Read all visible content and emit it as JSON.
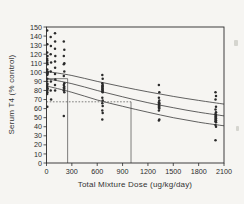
{
  "figure": {
    "background": "#f6f5f2",
    "ink": "#2b2b2b",
    "curve_color": "#3a3a3a"
  },
  "chart_data": {
    "type": "scatter",
    "title": "",
    "xlabel": "Total Mixture Dose (ug/kg/day)",
    "ylabel": "Serum T4 (% control)",
    "xlim": [
      0,
      2100
    ],
    "ylim": [
      0,
      150
    ],
    "x_ticks": [
      0,
      300,
      600,
      900,
      1200,
      1500,
      1800,
      2100
    ],
    "y_ticks": [
      0,
      10,
      20,
      30,
      40,
      50,
      60,
      70,
      80,
      90,
      100,
      110,
      120,
      130,
      140,
      150
    ],
    "grid": false,
    "legend": null,
    "points": [
      [
        8,
        146
      ],
      [
        10,
        131
      ],
      [
        8,
        122
      ],
      [
        12,
        118
      ],
      [
        8,
        115
      ],
      [
        10,
        113
      ],
      [
        8,
        111
      ],
      [
        12,
        109
      ],
      [
        8,
        103
      ],
      [
        10,
        101
      ],
      [
        14,
        100
      ],
      [
        8,
        99
      ],
      [
        12,
        98
      ],
      [
        8,
        97
      ],
      [
        10,
        93
      ],
      [
        8,
        90
      ],
      [
        12,
        87
      ],
      [
        8,
        85
      ],
      [
        10,
        83
      ],
      [
        14,
        82
      ],
      [
        8,
        80
      ],
      [
        10,
        78
      ],
      [
        8,
        76
      ],
      [
        10,
        62
      ],
      [
        50,
        139
      ],
      [
        52,
        129
      ],
      [
        50,
        120
      ],
      [
        54,
        111
      ],
      [
        50,
        101
      ],
      [
        52,
        90
      ],
      [
        50,
        80
      ],
      [
        54,
        70
      ],
      [
        100,
        143
      ],
      [
        102,
        134
      ],
      [
        100,
        126
      ],
      [
        104,
        118
      ],
      [
        100,
        112
      ],
      [
        102,
        105
      ],
      [
        100,
        98
      ],
      [
        104,
        92
      ],
      [
        100,
        86
      ],
      [
        102,
        80
      ],
      [
        205,
        134
      ],
      [
        210,
        125
      ],
      [
        205,
        118
      ],
      [
        210,
        110
      ],
      [
        205,
        109
      ],
      [
        210,
        101
      ],
      [
        205,
        96
      ],
      [
        210,
        88
      ],
      [
        205,
        86
      ],
      [
        210,
        84
      ],
      [
        205,
        83
      ],
      [
        210,
        82
      ],
      [
        205,
        80
      ],
      [
        210,
        78
      ],
      [
        205,
        52
      ],
      [
        660,
        97
      ],
      [
        665,
        93
      ],
      [
        660,
        88
      ],
      [
        665,
        86
      ],
      [
        660,
        85
      ],
      [
        665,
        84
      ],
      [
        660,
        83
      ],
      [
        665,
        82
      ],
      [
        660,
        81
      ],
      [
        665,
        80
      ],
      [
        660,
        79
      ],
      [
        665,
        78
      ],
      [
        660,
        72
      ],
      [
        665,
        69
      ],
      [
        660,
        66
      ],
      [
        665,
        63
      ],
      [
        660,
        58
      ],
      [
        665,
        55
      ],
      [
        660,
        48
      ],
      [
        1330,
        86
      ],
      [
        1335,
        78
      ],
      [
        1330,
        72
      ],
      [
        1335,
        69
      ],
      [
        1330,
        67
      ],
      [
        1335,
        66
      ],
      [
        1330,
        65
      ],
      [
        1335,
        64
      ],
      [
        1330,
        63
      ],
      [
        1335,
        62
      ],
      [
        1330,
        61
      ],
      [
        1335,
        60
      ],
      [
        1330,
        58
      ],
      [
        1335,
        48
      ],
      [
        1330,
        47
      ],
      [
        2000,
        78
      ],
      [
        2005,
        74
      ],
      [
        2000,
        70
      ],
      [
        2005,
        62
      ],
      [
        2000,
        59
      ],
      [
        2005,
        56
      ],
      [
        2000,
        54
      ],
      [
        2005,
        53
      ],
      [
        2000,
        52
      ],
      [
        2005,
        51
      ],
      [
        2000,
        50
      ],
      [
        2005,
        49
      ],
      [
        2000,
        48
      ],
      [
        2005,
        47
      ],
      [
        2000,
        46
      ],
      [
        2005,
        45
      ],
      [
        2000,
        42
      ],
      [
        2005,
        40
      ],
      [
        2000,
        25
      ]
    ],
    "curves": [
      {
        "name": "upper-confidence-curve",
        "points": [
          [
            0,
            101
          ],
          [
            300,
            96.5
          ],
          [
            600,
            90
          ],
          [
            900,
            84
          ],
          [
            1200,
            78.5
          ],
          [
            1500,
            73.5
          ],
          [
            1800,
            69
          ],
          [
            2100,
            65
          ]
        ]
      },
      {
        "name": "fitted-curve",
        "points": [
          [
            0,
            93
          ],
          [
            300,
            87.5
          ],
          [
            600,
            80
          ],
          [
            900,
            73
          ],
          [
            1200,
            66.5
          ],
          [
            1500,
            61
          ],
          [
            1800,
            56
          ],
          [
            2100,
            52
          ]
        ]
      },
      {
        "name": "lower-confidence-curve",
        "points": [
          [
            0,
            85
          ],
          [
            300,
            78
          ],
          [
            600,
            69.5
          ],
          [
            900,
            62.5
          ],
          [
            1200,
            56
          ],
          [
            1500,
            50
          ],
          [
            1800,
            45
          ],
          [
            2100,
            41
          ]
        ]
      }
    ],
    "reference_lines": [
      {
        "name": "effect-level-upper-hline",
        "type": "horizontal",
        "value": 93,
        "from_dose": 0,
        "to_dose": 250,
        "style": "solid"
      },
      {
        "name": "effective-dose-upper-vline",
        "type": "vertical",
        "dose": 250,
        "from_value": 0,
        "to_value": 93,
        "style": "solid"
      },
      {
        "name": "effect-level-lower-hline",
        "type": "horizontal",
        "value": 67.5,
        "from_dose": 0,
        "to_dose": 1000,
        "style": "dotted"
      },
      {
        "name": "effective-dose-lower-vline",
        "type": "vertical",
        "dose": 1000,
        "from_value": 0,
        "to_value": 67.5,
        "style": "solid"
      }
    ]
  }
}
